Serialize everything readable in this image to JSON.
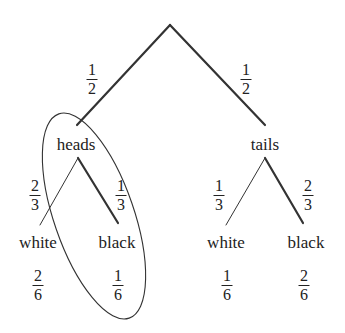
{
  "diagram": {
    "type": "probability-tree",
    "level1": {
      "left": {
        "label": "heads",
        "prob_num": "1",
        "prob_den": "2"
      },
      "right": {
        "label": "tails",
        "prob_num": "1",
        "prob_den": "2"
      }
    },
    "heads_branch": {
      "white": {
        "label": "white",
        "prob_num": "2",
        "prob_den": "3",
        "joint_num": "2",
        "joint_den": "6"
      },
      "black": {
        "label": "black",
        "prob_num": "1",
        "prob_den": "3",
        "joint_num": "1",
        "joint_den": "6"
      }
    },
    "tails_branch": {
      "white": {
        "label": "white",
        "prob_num": "1",
        "prob_den": "3",
        "joint_num": "1",
        "joint_den": "6"
      },
      "black": {
        "label": "black",
        "prob_num": "2",
        "prob_den": "3",
        "joint_num": "2",
        "joint_den": "6"
      }
    },
    "highlight": "ellipse around heads branch"
  }
}
